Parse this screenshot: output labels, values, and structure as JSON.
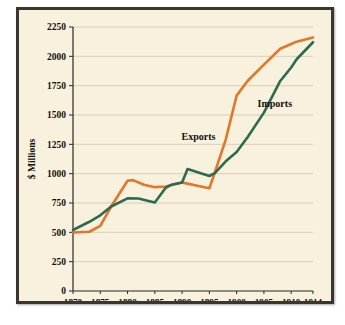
{
  "chart_data": {
    "type": "line",
    "title": "",
    "xlabel": "",
    "ylabel": "$ Millions",
    "xlim": [
      1870,
      1914
    ],
    "ylim": [
      0,
      2250
    ],
    "grid": true,
    "legend_position": "inline-annotations",
    "xtick_labels": [
      "1870",
      "1875",
      "1880",
      "1885",
      "1890",
      "1895",
      "1900",
      "1905",
      "1910",
      "1914"
    ],
    "xticks": [
      1870,
      1875,
      1880,
      1885,
      1890,
      1895,
      1900,
      1905,
      1910,
      1914
    ],
    "ytick_labels": [
      "0",
      "250",
      "500",
      "750",
      "1000",
      "1250",
      "1500",
      "1750",
      "2000",
      "2250"
    ],
    "yticks": [
      0,
      250,
      500,
      750,
      1000,
      1250,
      1500,
      1750,
      2000,
      2250
    ],
    "series": [
      {
        "name": "Exports",
        "color": "#e2762a",
        "x": [
          1870,
          1873,
          1875,
          1877,
          1880,
          1881,
          1883,
          1885,
          1887,
          1890,
          1891,
          1893,
          1895,
          1896,
          1898,
          1900,
          1902,
          1905,
          1908,
          1910,
          1911,
          1914
        ],
        "values": [
          498,
          505,
          555,
          720,
          940,
          945,
          905,
          885,
          890,
          925,
          915,
          895,
          875,
          1010,
          1290,
          1665,
          1790,
          1930,
          2065,
          2105,
          2125,
          2160
        ]
      },
      {
        "name": "Imports",
        "color": "#2e6a50",
        "x": [
          1870,
          1873,
          1875,
          1877,
          1880,
          1882,
          1885,
          1887,
          1888,
          1890,
          1891,
          1893,
          1895,
          1896,
          1898,
          1900,
          1902,
          1905,
          1908,
          1910,
          1911,
          1914
        ],
        "values": [
          520,
          590,
          645,
          720,
          790,
          788,
          755,
          880,
          905,
          925,
          1040,
          1010,
          980,
          1005,
          1105,
          1185,
          1310,
          1520,
          1790,
          1905,
          1975,
          2120
        ]
      }
    ],
    "annotations": [
      {
        "text": "Exports",
        "x": 1893,
        "y": 1290
      },
      {
        "text": "Imports",
        "x": 1907,
        "y": 1565
      }
    ]
  }
}
